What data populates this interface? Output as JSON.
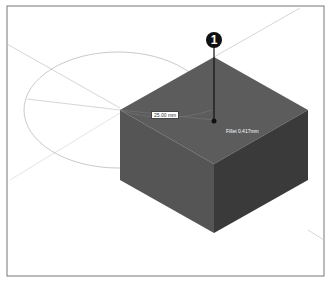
{
  "figure": {
    "callout_number": "1",
    "dimension_label_1": "25.00 mm",
    "dimension_label_2": "Fillet 0.417mm"
  },
  "colors": {
    "top_face": "#5a5a5a",
    "left_face": "#555555",
    "right_face": "#3a3a3a",
    "frame": "#777777",
    "guides": "#cccccc"
  }
}
